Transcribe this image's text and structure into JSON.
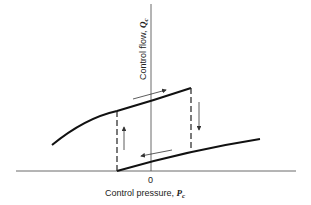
{
  "diagram": {
    "type": "hysteresis-curve",
    "x_axis": {
      "label": "Control pressure, ",
      "symbol": "P",
      "subscript": "c",
      "origin_label": "0"
    },
    "y_axis": {
      "label": "Control flow, ",
      "symbol": "Q",
      "subscript": "c"
    },
    "curves": [
      {
        "name": "upper-branch",
        "direction": "increasing pressure (arrow right)"
      },
      {
        "name": "lower-branch",
        "direction": "decreasing pressure (arrow left)"
      }
    ],
    "transitions": [
      {
        "name": "jump-up",
        "direction": "up",
        "style": "dashed"
      },
      {
        "name": "jump-down",
        "direction": "down",
        "style": "dashed"
      }
    ]
  }
}
